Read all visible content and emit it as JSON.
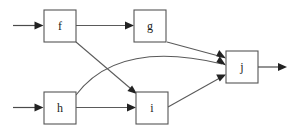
{
  "diagram": {
    "type": "directed-graph",
    "canvas": {
      "width": 299,
      "height": 134
    },
    "colors": {
      "background": "#ffffff",
      "node_stroke": "#555555",
      "node_fill": "#ffffff",
      "edge_stroke": "#5a5a5a",
      "arrow_fill": "#222222",
      "label_color": "#1a1a1a"
    },
    "nodes": [
      {
        "id": "f",
        "label": "f",
        "x": 44,
        "y": 10,
        "width": 32,
        "height": 32
      },
      {
        "id": "g",
        "label": "g",
        "x": 134,
        "y": 10,
        "width": 32,
        "height": 32
      },
      {
        "id": "j",
        "label": "j",
        "x": 226,
        "y": 51,
        "width": 32,
        "height": 32
      },
      {
        "id": "h",
        "label": "h",
        "x": 44,
        "y": 92,
        "width": 32,
        "height": 32
      },
      {
        "id": "i",
        "label": "i",
        "x": 136,
        "y": 92,
        "width": 32,
        "height": 32
      }
    ],
    "edges": [
      {
        "id": "edge-in-f",
        "from": "",
        "to": "f",
        "kind": "input",
        "shape": "straight"
      },
      {
        "id": "edge-in-h",
        "from": "",
        "to": "h",
        "kind": "input",
        "shape": "straight"
      },
      {
        "id": "edge-f-g",
        "from": "f",
        "to": "g",
        "kind": "internal",
        "shape": "straight"
      },
      {
        "id": "edge-f-i",
        "from": "f",
        "to": "i",
        "kind": "internal",
        "shape": "straight"
      },
      {
        "id": "edge-g-j",
        "from": "g",
        "to": "j",
        "kind": "internal",
        "shape": "straight"
      },
      {
        "id": "edge-h-i",
        "from": "h",
        "to": "i",
        "kind": "internal",
        "shape": "straight"
      },
      {
        "id": "edge-h-j",
        "from": "h",
        "to": "j",
        "kind": "internal",
        "shape": "curved"
      },
      {
        "id": "edge-i-j",
        "from": "i",
        "to": "j",
        "kind": "internal",
        "shape": "straight"
      },
      {
        "id": "edge-out-j",
        "from": "j",
        "to": "",
        "kind": "output",
        "shape": "straight"
      }
    ]
  }
}
